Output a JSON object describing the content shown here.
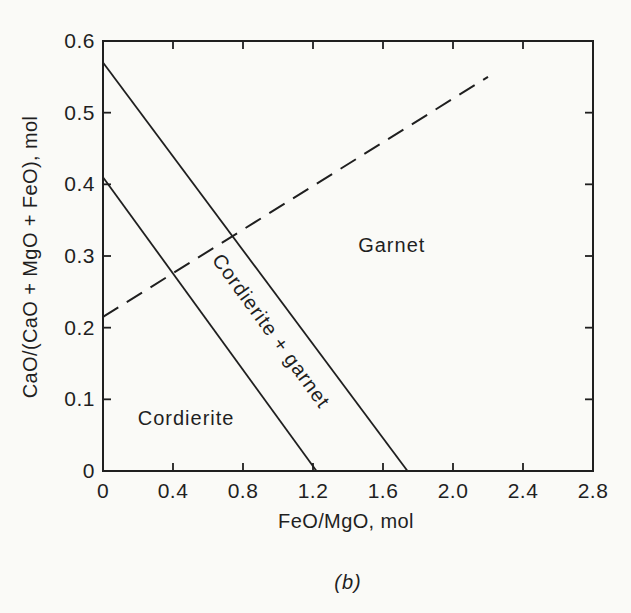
{
  "figure": {
    "ink_color": "#1f1f1f",
    "paper_color": "#fafaf7"
  },
  "chart_data": {
    "type": "line",
    "subtype": "phase-diagram",
    "title": "",
    "xlabel": "FeO/MgO, mol",
    "ylabel": "CaO/(CaO + MgO + FeO), mol",
    "caption": "(b)",
    "xlim": [
      0,
      2.8
    ],
    "ylim": [
      0,
      0.6
    ],
    "xticks": [
      0,
      0.4,
      0.8,
      1.2,
      1.6,
      2.0,
      2.4,
      2.8
    ],
    "xtick_labels": [
      "0",
      "0.4",
      "0.8",
      "1.2",
      "1.6",
      "2.0",
      "2.4",
      "2.8"
    ],
    "yticks": [
      0,
      0.1,
      0.2,
      0.3,
      0.4,
      0.5,
      0.6
    ],
    "ytick_labels": [
      "0",
      "0.1",
      "0.2",
      "0.3",
      "0.4",
      "0.5",
      "0.6"
    ],
    "grid": false,
    "legend": "none",
    "series": [
      {
        "name": "upper-solid-boundary",
        "style": "solid",
        "points": [
          [
            0,
            0.57
          ],
          [
            1.74,
            0
          ]
        ]
      },
      {
        "name": "lower-solid-boundary",
        "style": "solid",
        "points": [
          [
            0,
            0.41
          ],
          [
            1.22,
            0
          ]
        ]
      },
      {
        "name": "dashed-boundary",
        "style": "dashed",
        "points": [
          [
            0,
            0.215
          ],
          [
            2.2,
            0.55
          ]
        ]
      }
    ],
    "region_labels": [
      {
        "text": "Garnet",
        "x": 1.65,
        "y": 0.305,
        "rotation": 0
      },
      {
        "text": "Cordierite + garnet",
        "x": 0.93,
        "y": 0.19,
        "rotation": 54
      },
      {
        "text": "Cordierite",
        "x": 0.475,
        "y": 0.064,
        "rotation": 0
      }
    ]
  }
}
